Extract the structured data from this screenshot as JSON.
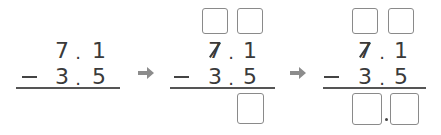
{
  "problem": {
    "minuend": {
      "ones": "7",
      "point": ".",
      "tenths": "1"
    },
    "subtrahend": {
      "operator": "−",
      "ones": "3",
      "point": ".",
      "tenths": "5"
    }
  },
  "steps": [
    {
      "label": "step-1",
      "minuend_struck": false,
      "top_boxes": 0,
      "answer_boxes": 0
    },
    {
      "label": "step-2",
      "minuend_struck": true,
      "top_boxes": 2,
      "answer_boxes": 1
    },
    {
      "label": "step-3",
      "minuend_struck": true,
      "top_boxes": 2,
      "answer_boxes": 2,
      "answer_point": "."
    }
  ],
  "arrows": [
    "arrow-right",
    "arrow-right"
  ],
  "colors": {
    "text": "#3a3a3a",
    "box_border": "#8a8a8a",
    "arrow": "#8c8c8c",
    "rule": "#555555"
  }
}
